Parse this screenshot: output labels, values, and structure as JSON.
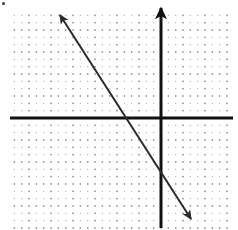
{
  "figure": {
    "kind": "coordinate-plane-line-graph",
    "width": 238,
    "height": 230,
    "background": "#ffffff"
  },
  "grid": {
    "style": "dotted",
    "minor_dot_color": "#b9b9b9",
    "major_dot_color": "#8a8a8a",
    "minor_spacing_px": 7.33,
    "major_spacing_px": 22,
    "left_px": 10,
    "right_px": 231,
    "top_px": 11,
    "bottom_px": 228,
    "show_grid": true,
    "show_tick_labels": false,
    "show_axis_labels": false
  },
  "axes": {
    "origin_px": {
      "x": 161,
      "y": 118
    },
    "x_axis": {
      "name": "x-axis",
      "color": "#111111",
      "thickness_px": 3,
      "from_px": {
        "x": 10,
        "y": 118
      },
      "to_px": {
        "x": 233,
        "y": 118
      },
      "arrowheads": "none"
    },
    "y_axis": {
      "name": "y-axis",
      "color": "#111111",
      "thickness_px": 3,
      "from_px": {
        "x": 161,
        "y": 228
      },
      "to_px": {
        "x": 161,
        "y": 8
      },
      "arrowheads": "top"
    }
  },
  "chart_data": {
    "type": "line",
    "title": "",
    "subtitle": "",
    "xlabel": "",
    "ylabel": "",
    "grid": true,
    "legend": "none",
    "xlim": [
      -6.9,
      3.2
    ],
    "ylim": [
      -5.0,
      4.9
    ],
    "xticks": [],
    "yticks": [],
    "tick_labels_shown": false,
    "series": [
      {
        "name": "line",
        "kind": "straight-line-with-double-arrow",
        "color": "#2b2b2b",
        "thickness_px": 2,
        "slope": -1.63,
        "y_intercept": -2.82,
        "x_intercept": -1.73,
        "equation": "y = -1.63x - 2.82",
        "x": [
          -4.6,
          1.3
        ],
        "y": [
          4.7,
          -4.9
        ],
        "endpoints_px": [
          {
            "x": 60,
            "y": 15
          },
          {
            "x": 191,
            "y": 219
          }
        ],
        "crosses_x_axis_px": {
          "x": 123,
          "y": 118
        },
        "crosses_y_axis_px": {
          "x": 161,
          "y": 180
        },
        "arrowheads": "both"
      }
    ],
    "annotations": [
      {
        "name": "corner-speck",
        "px": {
          "x": 3,
          "y": 3
        },
        "color": "#3a3a3a"
      }
    ]
  }
}
